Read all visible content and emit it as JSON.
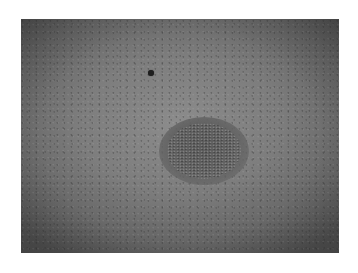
{
  "image": {
    "description": "Grayscale close-up photograph of a textured skin surface with a darker oval speckled lesion and a small dark spot",
    "colors": {
      "page_background": "#ffffff",
      "center_tone": "#8c8c8c",
      "edge_tone": "#505050",
      "lesion_tone": "#5a5a5a",
      "dark_spot": "#1e1e1e"
    },
    "features": [
      {
        "name": "dark-spot",
        "x": 151,
        "y": 73,
        "diameter": 6
      },
      {
        "name": "oval-lesion",
        "x": 203,
        "y": 150,
        "width": 90,
        "height": 68
      }
    ]
  }
}
